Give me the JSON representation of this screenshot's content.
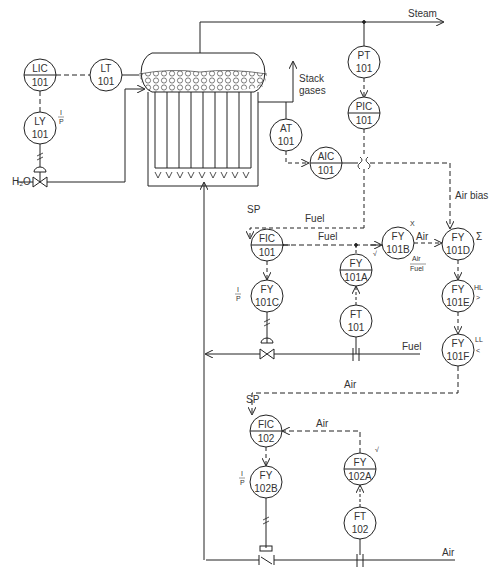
{
  "diagram": {
    "type": "P&ID - boiler drum level, steam pressure and combustion (fuel/air) control",
    "colors": {
      "line": "#222222",
      "text": "#333333",
      "background": "#ffffff"
    },
    "streams": {
      "steam": "Steam",
      "stack": "Stack gases",
      "water": "H₂O",
      "fuel_in": "Fuel",
      "air_in": "Air"
    },
    "signal_labels": {
      "fuel_sp": "Fuel",
      "fuel_meas": "Fuel",
      "air_bias": "Air bias",
      "air_sp": "Air",
      "air_meas": "Air",
      "air_ratio_in": "Air",
      "sp1": "SP",
      "sp2": "SP",
      "ratio_num": "Air",
      "ratio_den": "Fuel"
    },
    "function_symbols": {
      "fy101b": "X",
      "fy101d": "Σ",
      "fy101e_a": "HL",
      "fy101e_b": ">",
      "fy101f_a": "LL",
      "fy101f_b": "<",
      "fy101a": "√",
      "fy102a": "√",
      "ly101_num": "I",
      "ly101_den": "P",
      "fy101c_num": "I",
      "fy101c_den": "P",
      "fy102b_num": "I",
      "fy102b_den": "P"
    },
    "instruments": {
      "lic101": {
        "tag": "LIC",
        "num": "101"
      },
      "lt101": {
        "tag": "LT",
        "num": "101"
      },
      "ly101": {
        "tag": "LY",
        "num": "101"
      },
      "pt101": {
        "tag": "PT",
        "num": "101"
      },
      "pic101": {
        "tag": "PIC",
        "num": "101"
      },
      "at101": {
        "tag": "AT",
        "num": "101"
      },
      "aic101": {
        "tag": "AIC",
        "num": "101"
      },
      "fic101": {
        "tag": "FIC",
        "num": "101"
      },
      "fy101a": {
        "tag": "FY",
        "num": "101A"
      },
      "fy101b": {
        "tag": "FY",
        "num": "101B"
      },
      "fy101c": {
        "tag": "FY",
        "num": "101C"
      },
      "fy101d": {
        "tag": "FY",
        "num": "101D"
      },
      "fy101e": {
        "tag": "FY",
        "num": "101E"
      },
      "fy101f": {
        "tag": "FY",
        "num": "101F"
      },
      "ft101": {
        "tag": "FT",
        "num": "101"
      },
      "fic102": {
        "tag": "FIC",
        "num": "102"
      },
      "fy102a": {
        "tag": "FY",
        "num": "102A"
      },
      "fy102b": {
        "tag": "FY",
        "num": "102B"
      },
      "ft102": {
        "tag": "FT",
        "num": "102"
      }
    }
  }
}
